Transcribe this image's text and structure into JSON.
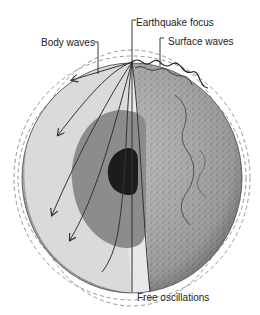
{
  "diagram": {
    "labels": {
      "earthquake_focus": "Earthquake focus",
      "surface_waves": "Surface waves",
      "body_waves": "Body waves",
      "free_oscillations": "Free oscillations"
    },
    "layers": [
      {
        "name": "mantle",
        "color": "#d9d9d9"
      },
      {
        "name": "outer-core",
        "color": "#8c8c8c"
      },
      {
        "name": "inner-core",
        "color": "#1c1c1c"
      },
      {
        "name": "surface",
        "color": "#a8a8a8"
      }
    ],
    "colors": {
      "background": "#ffffff",
      "text": "#222222",
      "ray": "#333333",
      "dashed": "#8a8a8a"
    }
  }
}
